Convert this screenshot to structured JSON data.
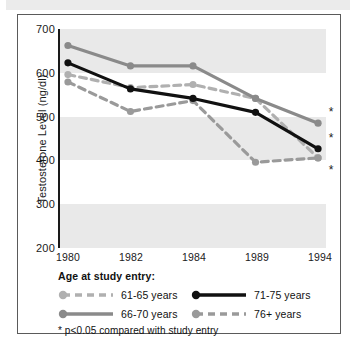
{
  "chart_data": {
    "type": "line",
    "title": "",
    "xlabel": "",
    "ylabel": "Testosterone Level (ng/dl)",
    "categories": [
      "1980",
      "1982",
      "1984",
      "1989",
      "1994"
    ],
    "ylim": [
      200,
      700
    ],
    "yticks": [
      200,
      300,
      400,
      500,
      600,
      700
    ],
    "grid": "alternating horizontal gray bands",
    "legend_position": "below-plot",
    "legend_title": "Age at study entry:",
    "series": [
      {
        "name": "61-65 years",
        "values": [
          595,
          565,
          572,
          540,
          403
        ],
        "color": "#b0b0b0",
        "style": "dashed"
      },
      {
        "name": "66-70 years",
        "values": [
          662,
          615,
          615,
          540,
          483
        ],
        "color": "#8a8a8a",
        "style": "solid"
      },
      {
        "name": "71-75 years",
        "values": [
          622,
          562,
          540,
          508,
          424
        ],
        "color": "#111111",
        "style": "solid"
      },
      {
        "name": "76+ years",
        "values": [
          578,
          510,
          535,
          393,
          403
        ],
        "color": "#9a9a9a",
        "style": "dashed"
      }
    ],
    "annotations": [
      {
        "label": "*",
        "x": "1994",
        "y": 510
      },
      {
        "label": "*",
        "x": "1994",
        "y": 452
      },
      {
        "label": "*",
        "x": "1994",
        "y": 378
      }
    ],
    "footnote": "* p<0.05 compared with study entry"
  }
}
